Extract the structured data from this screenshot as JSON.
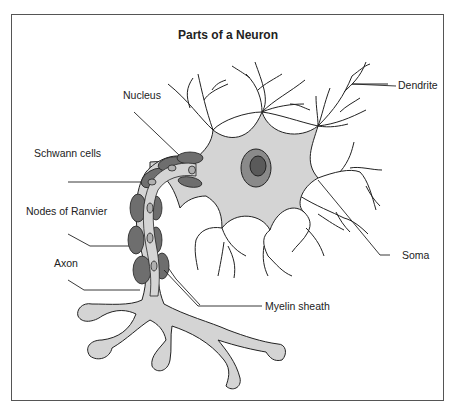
{
  "diagram": {
    "title": "Parts of a Neuron",
    "labels": {
      "dendrite": "Dendrite",
      "nucleus": "Nucleus",
      "schwann_cells": "Schwann cells",
      "nodes_of_ranvier": "Nodes of Ranvier",
      "axon": "Axon",
      "soma": "Soma",
      "myelin_sheath": "Myelin sheath"
    },
    "colors": {
      "cell_fill": "#d4d4d4",
      "nucleus_outer": "#8a8a8a",
      "nucleus_inner": "#5a5a5a",
      "myelin": "#6e6e6e",
      "outline": "#222222",
      "frame": "#555555"
    }
  }
}
